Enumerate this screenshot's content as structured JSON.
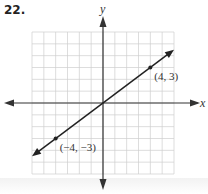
{
  "problem_number": "22.",
  "chart_data": {
    "type": "line",
    "title": "",
    "xlabel": "x",
    "ylabel": "y",
    "xlim": [
      -6,
      6
    ],
    "ylim": [
      -6,
      6
    ],
    "grid": true,
    "grid_step": 1,
    "series": [
      {
        "name": "line through origin",
        "equation": "y = 3/4 x",
        "x": [
          -6,
          6
        ],
        "y": [
          -4.5,
          4.5
        ],
        "arrows_both_ends": true
      }
    ],
    "points": [
      {
        "x": 4,
        "y": 3,
        "label": "(4, 3)"
      },
      {
        "x": -4,
        "y": -3,
        "label": "(−4, −3)"
      }
    ],
    "colors": {
      "grid": "#cfcfcf",
      "axis": "#333333",
      "line": "#222222"
    }
  }
}
